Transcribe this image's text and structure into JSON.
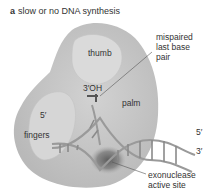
{
  "panel": {
    "letter": "a",
    "title": "slow or no DNA synthesis"
  },
  "labels": {
    "thumb": "thumb",
    "palm": "palm",
    "fingers": "fingers",
    "three_prime_oh": "3′OH",
    "mispaired_line1": "mispaired",
    "mispaired_line2": "last base",
    "mispaired_line3": "pair",
    "five_prime_left": "5′",
    "five_prime_right": "5′",
    "three_prime_right": "3′",
    "exonuclease_line1": "exonuclease",
    "exonuclease_line2": "active site"
  },
  "colors": {
    "protein": "#c8c8c8",
    "protein_light": "#dedede",
    "dna": "#9a9a9a",
    "active_site": "#6e6e6e",
    "text": "#333333"
  }
}
